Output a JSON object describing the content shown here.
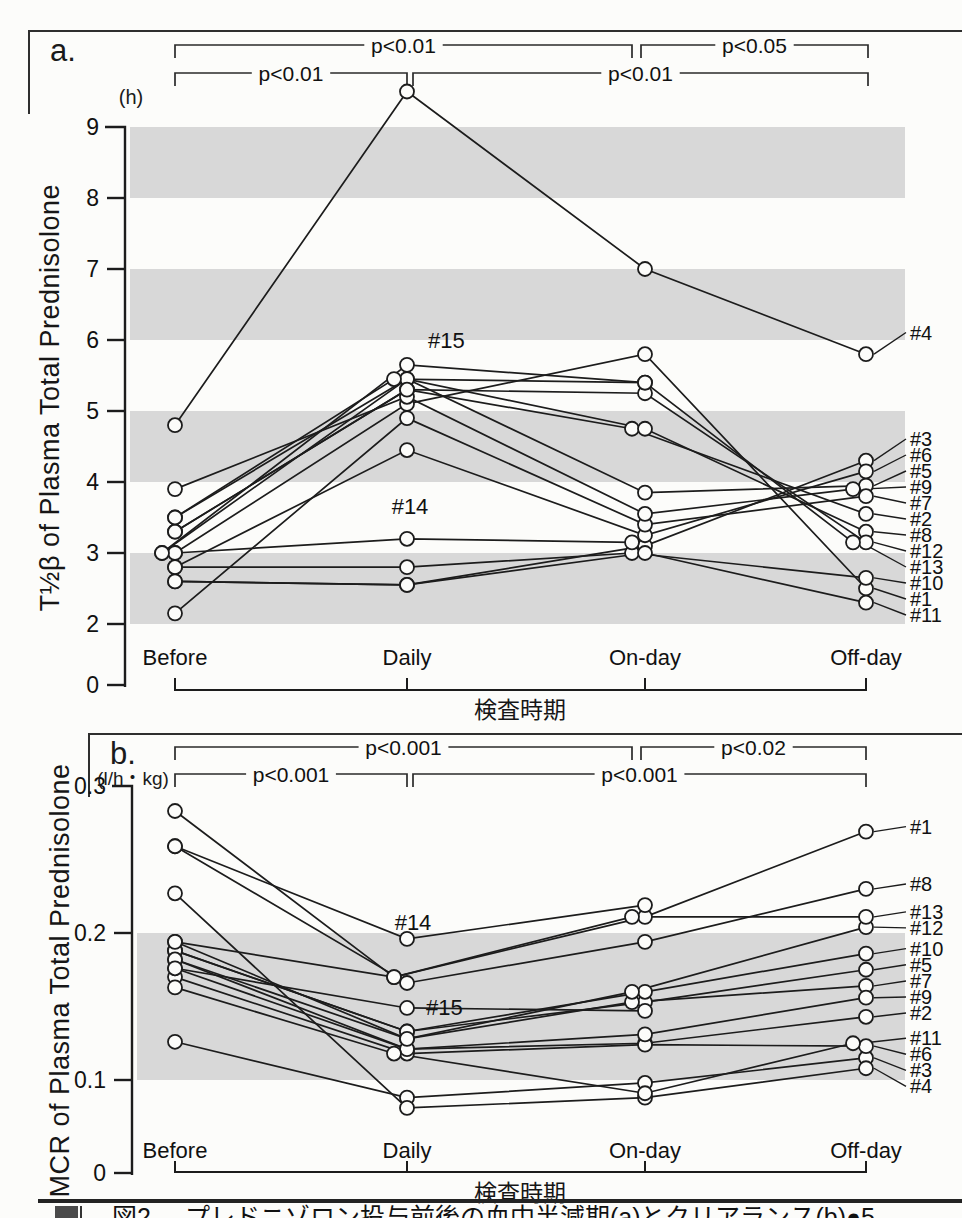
{
  "x_axis_title": "検査時期",
  "categories": [
    "Before",
    "Daily",
    "On-day",
    "Off-day"
  ],
  "caption": {
    "figure_label": "図2",
    "text": "プレドニゾロン投与前後の血中半減期(a)とクリアランス(b)●5"
  },
  "colors": {
    "band": "#d8d8d8",
    "line": "#1c1c1c",
    "background": "#fcfcfa"
  },
  "chart_data": [
    {
      "panel_tag": "a.",
      "type": "line",
      "ylabel": "T½β of Plasma Total Prednisolone",
      "unit": "(h)",
      "xlabel": "検査時期",
      "ylim": [
        0,
        9.6
      ],
      "grid": false,
      "legend": "none, subject numbers labeled at line ends",
      "yticks": [
        {
          "label": "9",
          "value": 9
        },
        {
          "label": "8",
          "value": 8
        },
        {
          "label": "7",
          "value": 7
        },
        {
          "label": "6",
          "value": 6
        },
        {
          "label": "5",
          "value": 5
        },
        {
          "label": "4",
          "value": 4
        },
        {
          "label": "3",
          "value": 3
        },
        {
          "label": "2",
          "value": 2
        },
        {
          "label": "0",
          "value": 0
        }
      ],
      "shaded_bands": [
        [
          2,
          3
        ],
        [
          4,
          5
        ],
        [
          6,
          7
        ],
        [
          8,
          9
        ]
      ],
      "significance": [
        {
          "label": "p<0.01",
          "from": "Before",
          "to": "On-day",
          "row": 0
        },
        {
          "label": "p<0.05",
          "from": "On-day",
          "to": "Off-day",
          "row": 0
        },
        {
          "label": "p<0.01",
          "from": "Before",
          "to": "Daily",
          "row": 1
        },
        {
          "label": "p<0.01",
          "from": "Daily",
          "to": "Off-day",
          "row": 1
        }
      ],
      "series": [
        {
          "name": "#1",
          "values": [
            3.0,
            5.1,
            5.8,
            2.5
          ]
        },
        {
          "name": "#2",
          "values": [
            3.3,
            5.3,
            4.75,
            3.55
          ]
        },
        {
          "name": "#3",
          "values": [
            2.6,
            2.55,
            3.1,
            4.3
          ]
        },
        {
          "name": "#4",
          "values": [
            4.8,
            9.5,
            7.0,
            5.8
          ]
        },
        {
          "name": "#5",
          "values": [
            3.5,
            5.45,
            3.85,
            3.95
          ]
        },
        {
          "name": "#6",
          "values": [
            2.8,
            4.45,
            3.25,
            4.15
          ]
        },
        {
          "name": "#7",
          "values": [
            2.15,
            4.9,
            3.4,
            3.8
          ]
        },
        {
          "name": "#8",
          "values": [
            3.0,
            5.45,
            4.75,
            3.3
          ]
        },
        {
          "name": "#9",
          "values": [
            3.9,
            5.2,
            3.55,
            3.9
          ]
        },
        {
          "name": "#10",
          "values": [
            2.8,
            2.8,
            3.0,
            2.65
          ]
        },
        {
          "name": "#11",
          "values": [
            2.6,
            2.55,
            3.0,
            2.3
          ]
        },
        {
          "name": "#12",
          "values": [
            3.3,
            5.3,
            5.25,
            3.15
          ]
        },
        {
          "name": "#13",
          "values": [
            3.5,
            5.45,
            5.4,
            3.15
          ]
        },
        {
          "name": "#14",
          "values": [
            3.0,
            3.2,
            3.15,
            null
          ]
        },
        {
          "name": "#15",
          "values": [
            3.0,
            5.65,
            5.4,
            null
          ]
        }
      ],
      "right_label_order": [
        "#4",
        "#3",
        "#6",
        "#5",
        "#9",
        "#7",
        "#2",
        "#8",
        "#12",
        "#13",
        "#10",
        "#1",
        "#11"
      ],
      "inline_labels": [
        {
          "series": "#14",
          "category": "Daily"
        },
        {
          "series": "#15",
          "category": "Daily"
        }
      ]
    },
    {
      "panel_tag": "b.",
      "type": "line",
      "ylabel": "MCR of Plasma Total Prednisolone",
      "unit": "(l/h・kg)",
      "xlabel": "検査時期",
      "ylim": [
        0,
        0.3
      ],
      "grid": false,
      "legend": "none, subject numbers labeled at line ends",
      "yticks": [
        {
          "label": "0.3",
          "value": 0.3
        },
        {
          "label": "0.2",
          "value": 0.2
        },
        {
          "label": "0.1",
          "value": 0.1
        },
        {
          "label": "0",
          "value": 0
        }
      ],
      "shaded_bands": [
        [
          0.1,
          0.2
        ]
      ],
      "significance": [
        {
          "label": "p<0.001",
          "from": "Before",
          "to": "On-day",
          "row": 0
        },
        {
          "label": "p<0.02",
          "from": "On-day",
          "to": "Off-day",
          "row": 0
        },
        {
          "label": "p<0.001",
          "from": "Before",
          "to": "Daily",
          "row": 1
        },
        {
          "label": "p<0.001",
          "from": "Daily",
          "to": "Off-day",
          "row": 1
        }
      ],
      "series": [
        {
          "name": "#1",
          "values": [
            0.283,
            0.17,
            0.211,
            0.269
          ]
        },
        {
          "name": "#2",
          "values": [
            0.182,
            0.121,
            0.125,
            0.143
          ]
        },
        {
          "name": "#3",
          "values": [
            0.126,
            0.088,
            0.098,
            0.115
          ]
        },
        {
          "name": "#4",
          "values": [
            0.227,
            0.081,
            0.088,
            0.108
          ]
        },
        {
          "name": "#5",
          "values": [
            0.188,
            0.133,
            0.153,
            0.175
          ]
        },
        {
          "name": "#6",
          "values": [
            0.17,
            0.118,
            0.124,
            0.123
          ]
        },
        {
          "name": "#7",
          "values": [
            0.194,
            0.128,
            0.153,
            0.164
          ]
        },
        {
          "name": "#8",
          "values": [
            0.259,
            0.166,
            0.194,
            0.23
          ]
        },
        {
          "name": "#9",
          "values": [
            0.176,
            0.121,
            0.131,
            0.156
          ]
        },
        {
          "name": "#10",
          "values": [
            0.188,
            0.133,
            0.16,
            0.186
          ]
        },
        {
          "name": "#11",
          "values": [
            0.163,
            0.118,
            0.091,
            0.125
          ]
        },
        {
          "name": "#12",
          "values": [
            0.182,
            0.128,
            0.16,
            0.204
          ]
        },
        {
          "name": "#13",
          "values": [
            0.194,
            0.17,
            0.211,
            0.211
          ]
        },
        {
          "name": "#14",
          "values": [
            0.259,
            0.196,
            0.219,
            null
          ]
        },
        {
          "name": "#15",
          "values": [
            0.176,
            0.149,
            0.147,
            null
          ]
        }
      ],
      "right_label_order": [
        "#1",
        "#8",
        "#13",
        "#12",
        "#10",
        "#5",
        "#7",
        "#9",
        "#2",
        "#11",
        "#6",
        "#3",
        "#4"
      ],
      "inline_labels": [
        {
          "series": "#14",
          "category": "Daily"
        },
        {
          "series": "#15",
          "category": "Daily"
        }
      ]
    }
  ]
}
